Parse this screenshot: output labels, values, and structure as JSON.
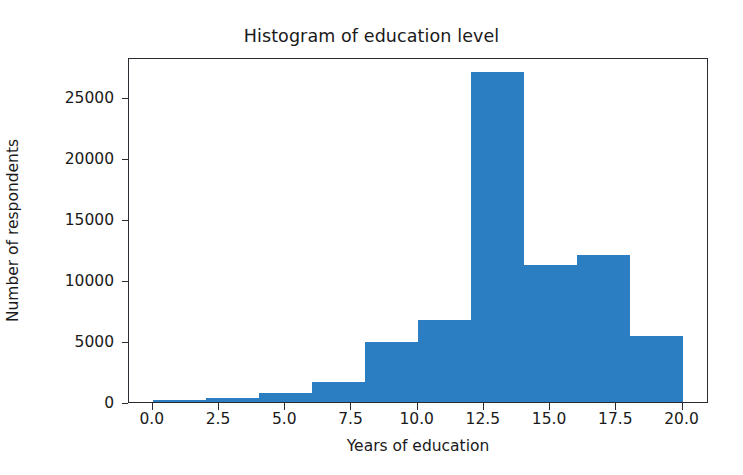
{
  "chart_data": {
    "type": "bar",
    "title": "Histogram of education level",
    "xlabel": "Years of education",
    "ylabel": "Number of respondents",
    "grid": false,
    "legend": false,
    "xlim": [
      -0.9,
      21.0
    ],
    "ylim": [
      0,
      28250
    ],
    "bin_width": 2,
    "bar_color": "#2b7ec1",
    "categories": [
      "0-2",
      "2-4",
      "4-6",
      "6-8",
      "8-10",
      "10-12",
      "12-14",
      "14-16",
      "16-18",
      "18-20"
    ],
    "bin_edges": [
      0,
      2,
      4,
      6,
      8,
      10,
      12,
      14,
      16,
      18,
      20
    ],
    "values": [
      150,
      330,
      700,
      1650,
      4900,
      6700,
      27000,
      11200,
      12000,
      5400
    ],
    "xticks": [
      0.0,
      2.5,
      5.0,
      7.5,
      10.0,
      12.5,
      15.0,
      17.5,
      20.0
    ],
    "xticklabels": [
      "0.0",
      "2.5",
      "5.0",
      "7.5",
      "10.0",
      "12.5",
      "15.0",
      "17.5",
      "20.0"
    ],
    "yticks": [
      0,
      5000,
      10000,
      15000,
      20000,
      25000
    ],
    "yticklabels": [
      "0",
      "5000",
      "10000",
      "15000",
      "20000",
      "25000"
    ]
  }
}
